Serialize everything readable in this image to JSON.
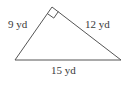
{
  "diagram": {
    "type": "right-triangle",
    "colors": {
      "stroke": "#555555",
      "text": "#3a3a3a",
      "background": "#ffffff"
    },
    "vertices": {
      "top": [
        52,
        7
      ],
      "bottom_left": [
        15,
        60
      ],
      "bottom_right": [
        121,
        60
      ]
    },
    "right_angle_at": "top",
    "sides": {
      "left": {
        "label": "9 yd"
      },
      "right": {
        "label": "12 yd"
      },
      "bottom": {
        "label": "15 yd"
      }
    }
  }
}
